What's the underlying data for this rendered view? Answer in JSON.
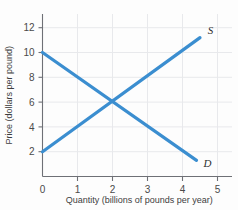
{
  "chart_data": {
    "type": "line",
    "title": "",
    "xlabel": "Quantity (billions of pounds per year)",
    "ylabel": "Price (dollars per pound)",
    "xlim": [
      0,
      5.4
    ],
    "ylim": [
      0,
      13
    ],
    "xticks": [
      "0",
      "1",
      "2",
      "3",
      "4",
      "5"
    ],
    "xtick_values": [
      0,
      1,
      2,
      3,
      4,
      5
    ],
    "yticks": [
      "2",
      "4",
      "6",
      "8",
      "10",
      "12"
    ],
    "ytick_values": [
      2,
      4,
      6,
      8,
      10,
      12
    ],
    "grid": true,
    "legend": "inline-curve-labels",
    "equilibrium": {
      "quantity": 2,
      "price": 6
    },
    "series": [
      {
        "name": "D",
        "label": "D",
        "description": "Demand curve",
        "color": "#3b8ed0",
        "x": [
          0.0,
          4.4
        ],
        "y": [
          10.0,
          1.3
        ],
        "label_x": 4.6,
        "label_y": 1.1
      },
      {
        "name": "S",
        "label": "S",
        "description": "Supply curve",
        "color": "#3b8ed0",
        "x": [
          0.0,
          4.5
        ],
        "y": [
          2.0,
          11.2
        ],
        "label_x": 4.72,
        "label_y": 11.8
      }
    ]
  },
  "colors": {
    "curve": "#3b8ed0",
    "axis": "#6e7076",
    "grid": "#e8e9ec",
    "text": "#3d3d3d",
    "background": "#fdfdfd"
  },
  "axis_titles": {
    "x": "Quantity (billions of pounds per year)",
    "y": "Price (dollars per pound)"
  }
}
